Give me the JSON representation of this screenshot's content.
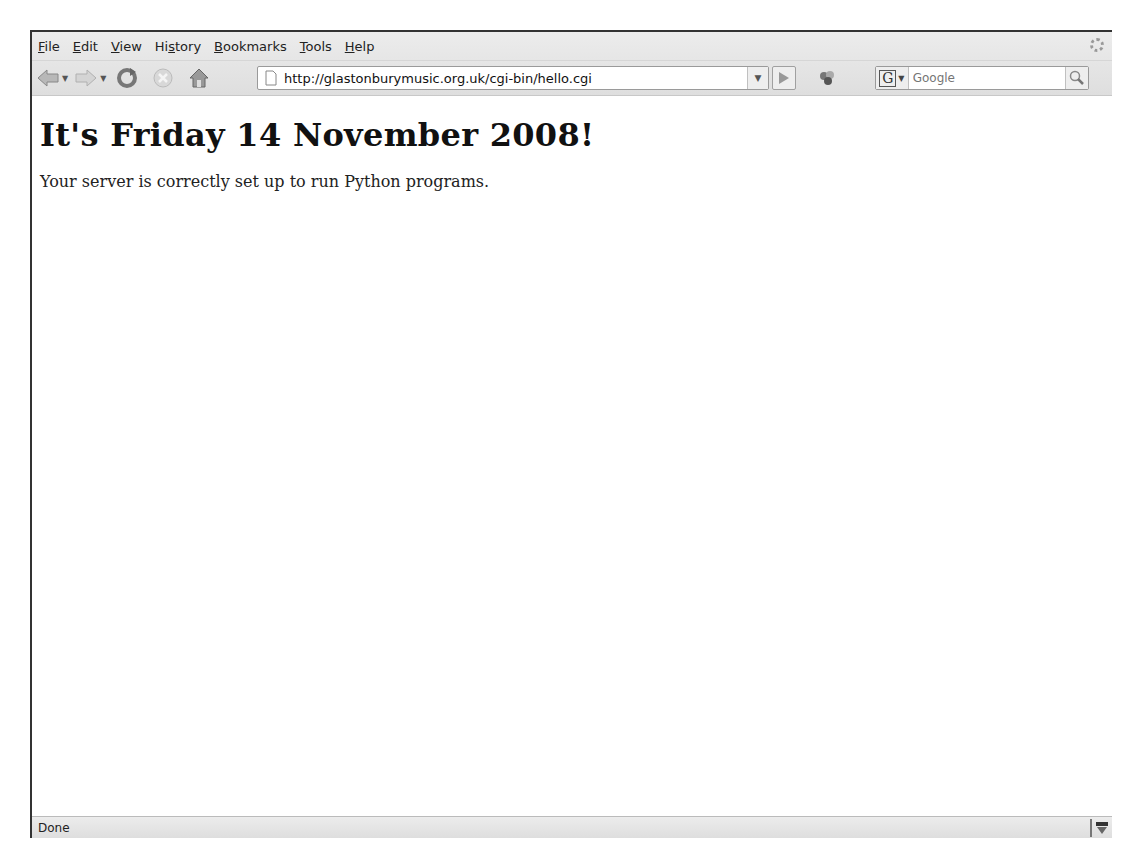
{
  "menubar": {
    "items": [
      {
        "label": "File",
        "accel": "F",
        "rest": "ile"
      },
      {
        "label": "Edit",
        "accel": "E",
        "rest": "dit"
      },
      {
        "label": "View",
        "accel": "V",
        "rest": "iew"
      },
      {
        "label": "History",
        "pre": "Hi",
        "accel": "s",
        "rest": "tory"
      },
      {
        "label": "Bookmarks",
        "accel": "B",
        "rest": "ookmarks"
      },
      {
        "label": "Tools",
        "accel": "T",
        "rest": "ools"
      },
      {
        "label": "Help",
        "accel": "H",
        "rest": "elp"
      }
    ]
  },
  "navbar": {
    "url": "http://glastonburymusic.org.uk/cgi-bin/hello.cgi",
    "search_placeholder": "Google",
    "search_engine": "G"
  },
  "page": {
    "heading": "It's Friday 14 November 2008!",
    "message": "Your server is correctly set up to run Python programs."
  },
  "status": {
    "text": "Done"
  }
}
